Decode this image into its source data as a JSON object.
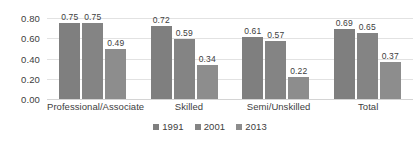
{
  "chart_data": {
    "type": "bar",
    "title": "",
    "subtitle": "",
    "xlabel": "",
    "ylabel": "",
    "ylim": [
      0,
      0.8
    ],
    "ytick_labels": [
      "0.80",
      "0.60",
      "0.40",
      "0.20",
      "0.00"
    ],
    "ytick_values": [
      0.8,
      0.6,
      0.4,
      0.2,
      0.0
    ],
    "grid": true,
    "legend_position": "bottom",
    "categories": [
      "Professional/Associate",
      "Skilled",
      "Semi/Unskilled",
      "Total"
    ],
    "series": [
      {
        "name": "1991",
        "color": "#7f7f7f",
        "values": [
          0.75,
          0.72,
          0.61,
          0.69
        ],
        "labels": [
          "0.75",
          "0.72",
          "0.61",
          "0.69"
        ]
      },
      {
        "name": "2001",
        "color": "#848484",
        "values": [
          0.75,
          0.59,
          0.57,
          0.65
        ],
        "labels": [
          "0.75",
          "0.59",
          "0.57",
          "0.65"
        ]
      },
      {
        "name": "2013",
        "color": "#8d8d8d",
        "values": [
          0.49,
          0.34,
          0.22,
          0.37
        ],
        "labels": [
          "0.49",
          "0.34",
          "0.22",
          "0.37"
        ]
      }
    ]
  }
}
